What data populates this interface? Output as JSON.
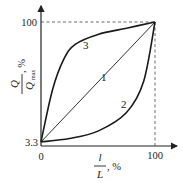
{
  "chart_data": {
    "type": "line",
    "title": "",
    "xlabel": {
      "numerator": "l",
      "denominator": "L",
      "unit": ", %"
    },
    "ylabel": {
      "numerator": "Q",
      "denominator": "Q",
      "denominator_sub": "max",
      "unit": ", %"
    },
    "xlim": [
      0,
      100
    ],
    "ylim": [
      0,
      100
    ],
    "x_ticks": [
      "0",
      "100"
    ],
    "y_ticks": [
      "3.3",
      "100"
    ],
    "grid": false,
    "reference_lines": [
      {
        "type": "horizontal",
        "y": 100,
        "style": "dashed"
      },
      {
        "type": "vertical",
        "x": 100,
        "style": "dashed"
      }
    ],
    "series": [
      {
        "name": "1",
        "shape": "linear",
        "x": [
          0,
          25,
          50,
          75,
          100
        ],
        "y": [
          3.3,
          27.5,
          51.7,
          75.8,
          100
        ]
      },
      {
        "name": "2",
        "shape": "convex",
        "x": [
          0,
          25,
          50,
          75,
          90,
          100
        ],
        "y": [
          3.3,
          6,
          12,
          27,
          52,
          100
        ]
      },
      {
        "name": "3",
        "shape": "concave",
        "x": [
          0,
          10,
          20,
          30,
          50,
          75,
          100
        ],
        "y": [
          3.3,
          45,
          70,
          82,
          90,
          95,
          100
        ]
      }
    ]
  }
}
